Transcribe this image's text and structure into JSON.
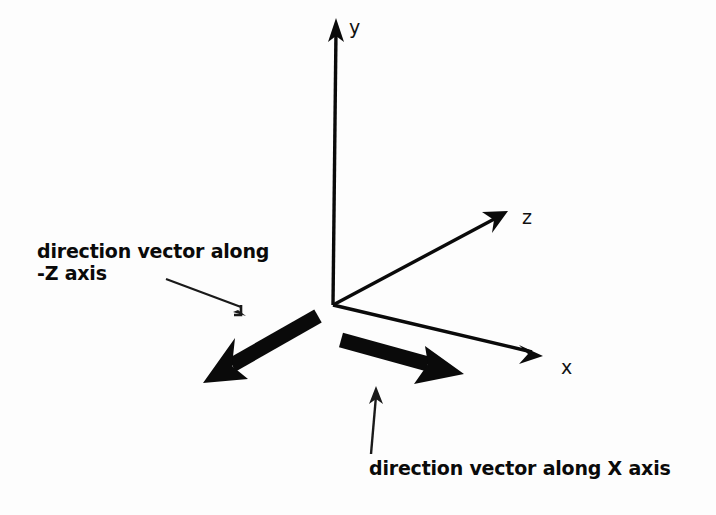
{
  "diagram": {
    "background_color": "#fdfdfd",
    "stroke_color": "#0a0a0a",
    "axes": [
      {
        "name": "y-axis",
        "label": "y",
        "from": [
          333,
          305
        ],
        "to": [
          337,
          22
        ],
        "style": "thin-arrow"
      },
      {
        "name": "z-axis",
        "label": "z",
        "from": [
          333,
          305
        ],
        "to": [
          506,
          212
        ],
        "style": "thin-arrow"
      },
      {
        "name": "x-axis",
        "label": "x",
        "from": [
          333,
          305
        ],
        "to": [
          540,
          355
        ],
        "style": "thin-arrow"
      }
    ],
    "vectors": [
      {
        "name": "negative-z-direction-vector",
        "from": [
          320,
          316
        ],
        "to": [
          206,
          381
        ],
        "style": "thick-arrow"
      },
      {
        "name": "positive-x-direction-vector",
        "from": [
          340,
          339
        ],
        "to": [
          462,
          373
        ],
        "style": "thick-arrow"
      }
    ],
    "annotations": [
      {
        "name": "negative-z-annotation",
        "line1": "direction vector along",
        "line2": "-Z axis",
        "leader": {
          "from": [
            166,
            279
          ],
          "to": [
            246,
            314
          ]
        }
      },
      {
        "name": "positive-x-annotation",
        "line1": "direction vector along X axis",
        "line2": "",
        "leader": {
          "from": [
            371,
            455
          ],
          "to": [
            376,
            387
          ]
        }
      }
    ],
    "labels": {
      "y": "y",
      "z": "z",
      "x": "x"
    }
  }
}
